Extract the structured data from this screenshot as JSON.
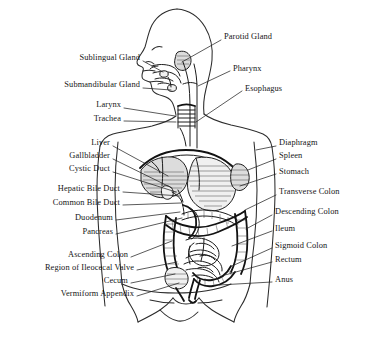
{
  "figure": {
    "background_color": "#ffffff",
    "ink_color": "#1c1c1c",
    "text_color": "#151515",
    "view": "lateral and anterior composite of head, neck and abdomen"
  },
  "labels_left": [
    {
      "id": "sublingual-gland",
      "text": "Sublingual Gland",
      "x": 58,
      "y": 57,
      "text_right": 140,
      "leader": "M 143 61 L 163 72"
    },
    {
      "id": "submandibular-gland",
      "text": "Submandibular Gland",
      "x": 37,
      "y": 84,
      "text_right": 140,
      "leader": "M 143 88 L 171 90"
    },
    {
      "id": "larynx",
      "text": "Larynx",
      "x": 83,
      "y": 104,
      "text_right": 121,
      "leader": "M 124 108 L 175 116"
    },
    {
      "id": "trachea",
      "text": "Trachea",
      "x": 77,
      "y": 118,
      "text_right": 121,
      "leader": "M 124 121 L 176 122"
    },
    {
      "id": "liver",
      "text": "Liver",
      "x": 79,
      "y": 142,
      "text_right": 110,
      "leader": "M 113 146 L 168 176"
    },
    {
      "id": "gallbladder",
      "text": "Gallbladder",
      "x": 50,
      "y": 155,
      "text_right": 110,
      "leader": "M 113 159 L 172 188"
    },
    {
      "id": "cystic-duct",
      "text": "Cystic Duct",
      "x": 51,
      "y": 168,
      "text_right": 110,
      "leader": "M 113 172 L 176 192"
    },
    {
      "id": "hepatic-bile-duct",
      "text": "Hepatic Bile Duct",
      "x": 28,
      "y": 188,
      "text_right": 120,
      "leader": "M 123 192 L 180 196"
    },
    {
      "id": "common-bile-duct",
      "text": "Common Bile Duct",
      "x": 22,
      "y": 202,
      "text_right": 120,
      "leader": "M 123 205 L 181 203"
    },
    {
      "id": "duodenum",
      "text": "Duodenum",
      "x": 55,
      "y": 217,
      "text_right": 113,
      "leader": "M 116 220 L 180 212"
    },
    {
      "id": "pancreas",
      "text": "Pancreas",
      "x": 62,
      "y": 231,
      "text_right": 113,
      "leader": "M 116 234 L 182 218"
    },
    {
      "id": "ascending-colon",
      "text": "Ascending Colon",
      "x": 40,
      "y": 254,
      "text_right": 128,
      "leader": "M 131 257 L 172 241"
    },
    {
      "id": "region-of-ileocecal-valve",
      "text": "Region of Ileocecal Valve",
      "x": 6,
      "y": 267,
      "text_right": 134,
      "leader": "M 137 270 L 177 262"
    },
    {
      "id": "cecum",
      "text": "Cecum",
      "x": 90,
      "y": 280,
      "text_right": 128,
      "leader": "M 131 283 L 175 274"
    },
    {
      "id": "vermiform-appendix",
      "text": "Vermiform Appendix",
      "x": 22,
      "y": 293,
      "text_right": 134,
      "leader": "M 137 296 L 179 283"
    }
  ],
  "labels_right": [
    {
      "id": "parotid-gland",
      "text": "Parotid Gland",
      "x": 224,
      "y": 36,
      "leader": "M 221 40 L 182 62"
    },
    {
      "id": "pharynx",
      "text": "Pharynx",
      "x": 233,
      "y": 68,
      "leader": "M 230 71 L 198 86"
    },
    {
      "id": "esophagus",
      "text": "Esophagus",
      "x": 245,
      "y": 88,
      "leader": "M 242 91 L 196 122"
    },
    {
      "id": "diaphragm",
      "text": "Diaphragm",
      "x": 279,
      "y": 142,
      "leader": "M 276 146 L 256 150"
    },
    {
      "id": "spleen",
      "text": "Spleen",
      "x": 279,
      "y": 155,
      "leader": "M 276 159 L 248 170"
    },
    {
      "id": "stomach",
      "text": "Stomach",
      "x": 279,
      "y": 171,
      "leader": "M 276 174 L 240 186"
    },
    {
      "id": "transverse-colon",
      "text": "Transverse Colon",
      "x": 279,
      "y": 191,
      "leader": "M 276 195 L 245 210"
    },
    {
      "id": "descending-colon",
      "text": "Descending Colon",
      "x": 275,
      "y": 211,
      "leader": "M 272 215 L 246 229"
    },
    {
      "id": "ileum",
      "text": "Ileum",
      "x": 275,
      "y": 228,
      "leader": "M 272 231 L 232 246"
    },
    {
      "id": "sigmoid-colon",
      "text": "Sigmoid Colon",
      "x": 275,
      "y": 245,
      "leader": "M 272 248 L 232 266"
    },
    {
      "id": "rectum",
      "text": "Rectum",
      "x": 275,
      "y": 259,
      "leader": "M 272 262 L 225 275"
    },
    {
      "id": "anus",
      "text": "Anus",
      "x": 275,
      "y": 279,
      "leader": "M 272 282 L 219 285"
    }
  ]
}
